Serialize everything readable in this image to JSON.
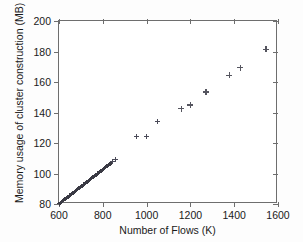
{
  "figure": {
    "background_color": "#fdfdfd",
    "axis_color": "#6e6e6e",
    "marker_color": "#4a4a58",
    "marker_symbol": "plus"
  },
  "chart_data": {
    "type": "scatter",
    "title": "",
    "xlabel": "Number of Flows (K)",
    "ylabel": "Memory usage of cluster construction (MB)",
    "xlim": [
      600,
      1600
    ],
    "ylim": [
      80,
      200
    ],
    "xticks": [
      600,
      800,
      1000,
      1200,
      1400,
      1600
    ],
    "yticks": [
      80,
      100,
      120,
      140,
      160,
      180,
      200
    ],
    "xtick_labels": [
      "600",
      "800",
      "1000",
      "1200",
      "1400",
      "1600"
    ],
    "ytick_labels": [
      "80",
      "100",
      "120",
      "140",
      "160",
      "180",
      "200"
    ],
    "grid": false,
    "legend": null,
    "series": [
      {
        "name": "Memory usage",
        "marker": "+",
        "points": [
          [
            602,
            80.3
          ],
          [
            606,
            80.8
          ],
          [
            610,
            81.2
          ],
          [
            614,
            81.7
          ],
          [
            618,
            82.1
          ],
          [
            622,
            82.6
          ],
          [
            626,
            83.0
          ],
          [
            630,
            83.5
          ],
          [
            634,
            83.9
          ],
          [
            638,
            84.4
          ],
          [
            642,
            84.8
          ],
          [
            646,
            85.3
          ],
          [
            650,
            85.7
          ],
          [
            654,
            86.2
          ],
          [
            658,
            86.6
          ],
          [
            662,
            87.1
          ],
          [
            666,
            87.5
          ],
          [
            670,
            88.0
          ],
          [
            674,
            88.4
          ],
          [
            678,
            88.9
          ],
          [
            682,
            89.3
          ],
          [
            686,
            89.8
          ],
          [
            690,
            90.2
          ],
          [
            694,
            90.7
          ],
          [
            698,
            91.1
          ],
          [
            702,
            91.6
          ],
          [
            706,
            92.0
          ],
          [
            710,
            92.5
          ],
          [
            714,
            92.9
          ],
          [
            718,
            93.4
          ],
          [
            722,
            93.8
          ],
          [
            726,
            94.3
          ],
          [
            730,
            94.7
          ],
          [
            734,
            95.2
          ],
          [
            738,
            95.6
          ],
          [
            742,
            96.1
          ],
          [
            746,
            96.5
          ],
          [
            750,
            97.0
          ],
          [
            754,
            97.4
          ],
          [
            758,
            97.9
          ],
          [
            762,
            98.3
          ],
          [
            766,
            98.8
          ],
          [
            770,
            99.2
          ],
          [
            774,
            99.7
          ],
          [
            778,
            100.1
          ],
          [
            782,
            100.6
          ],
          [
            786,
            101.0
          ],
          [
            790,
            101.5
          ],
          [
            794,
            101.9
          ],
          [
            798,
            102.4
          ],
          [
            802,
            102.8
          ],
          [
            806,
            103.3
          ],
          [
            810,
            103.7
          ],
          [
            814,
            104.2
          ],
          [
            818,
            104.6
          ],
          [
            822,
            105.1
          ],
          [
            826,
            105.5
          ],
          [
            830,
            106.0
          ],
          [
            834,
            106.4
          ],
          [
            838,
            106.9
          ],
          [
            845,
            108.0
          ],
          [
            860,
            109.5
          ],
          [
            955,
            124.0
          ],
          [
            1000,
            124.3
          ],
          [
            1048,
            134.0
          ],
          [
            1158,
            142.5
          ],
          [
            1200,
            145.0
          ],
          [
            1270,
            153.5
          ],
          [
            1378,
            164.5
          ],
          [
            1428,
            169.5
          ],
          [
            1545,
            181.5
          ]
        ]
      }
    ]
  }
}
